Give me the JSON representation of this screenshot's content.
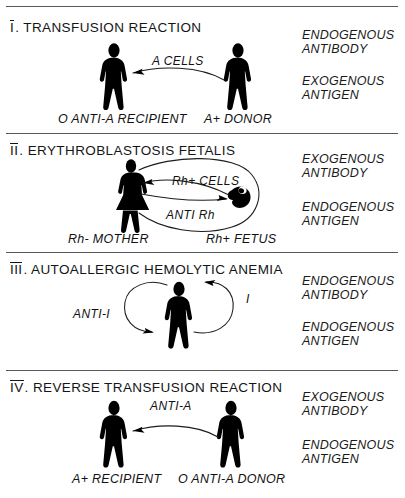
{
  "figure": {
    "title_note": "Four mechanisms of antibody-mediated blood cell destruction",
    "panels": [
      {
        "numeral": "I",
        "title": "TRANSFUSION   REACTION",
        "arrow_label": "A  CELLS",
        "left_caption": "O ANTI-A  RECIPIENT",
        "right_caption": "A+ DONOR",
        "side_lines": [
          "ENDOGENOUS",
          "ANTIBODY",
          "EXOGENOUS",
          "ANTIGEN"
        ],
        "figures": [
          "standing-person-recipient",
          "standing-person-donor"
        ],
        "arrow_direction": "right-to-left"
      },
      {
        "numeral": "II",
        "title": "ERYTHROBLASTOSIS   FETALIS",
        "arrow_label_top": "Rh+ CELLS",
        "arrow_label_bottom": "ANTI Rh",
        "left_caption": "Rh- MOTHER",
        "right_caption": "Rh+ FETUS",
        "side_lines": [
          "EXOGENOUS",
          "ANTIBODY",
          "ENDOGENOUS",
          "ANTIGEN"
        ],
        "figures": [
          "standing-mother-figure",
          "curled-fetus-figure"
        ],
        "arrow_direction": "bidirectional"
      },
      {
        "numeral": "III",
        "title": "AUTOALLERGIC   HEMOLYTIC   ANEMIA",
        "arrow_label_left": "ANTI-I",
        "arrow_label_right": "I",
        "side_lines": [
          "ENDOGENOUS",
          "ANTIBODY",
          "ENDOGENOUS",
          "ANTIGEN"
        ],
        "figures": [
          "standing-person-self"
        ],
        "arrow_direction": "self-loop-both-sides"
      },
      {
        "numeral": "IV",
        "title": "REVERSE   TRANSFUSION   REACTION",
        "arrow_label": "ANTI-A",
        "left_caption": "A+ RECIPIENT",
        "right_caption": "O ANTI-A  DONOR",
        "side_lines": [
          "EXOGENOUS",
          "ANTIBODY",
          "ENDOGENOUS",
          "ANTIGEN"
        ],
        "figures": [
          "standing-person-recipient",
          "standing-person-donor"
        ],
        "arrow_direction": "right-to-left"
      }
    ],
    "colors": {
      "ink": "#111111",
      "rule": "#555a5e",
      "background": "#ffffff"
    }
  }
}
